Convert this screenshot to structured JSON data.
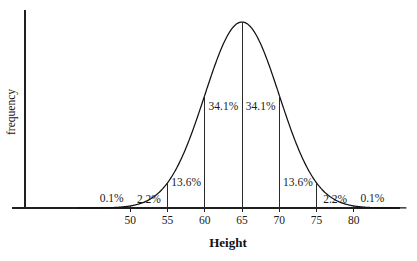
{
  "chart_data": {
    "type": "line",
    "title": "",
    "subtitle": "",
    "xlabel": "Height",
    "ylabel": "frequency",
    "distribution": "normal",
    "mean": 65,
    "std_dev": 5,
    "xlim": [
      43,
      87
    ],
    "ylim": [
      0,
      1
    ],
    "grid": false,
    "legend": false,
    "x_ticks": [
      50,
      55,
      60,
      65,
      70,
      75,
      80
    ],
    "x_tick_labels": [
      "50",
      "55",
      "60",
      "65",
      "70",
      "75",
      "80"
    ],
    "y_ticks": [],
    "y_tick_labels": [],
    "divider_positions": [
      50,
      55,
      60,
      65,
      70,
      75,
      80
    ],
    "region_labels": [
      {
        "label": "0.1%",
        "x_center": 47.5,
        "value": 0.1
      },
      {
        "label": "2.2%",
        "x_center": 52.5,
        "value": 2.2
      },
      {
        "label": "13.6%",
        "x_center": 57.5,
        "value": 13.6
      },
      {
        "label": "34.1%",
        "x_center": 62.5,
        "value": 34.1
      },
      {
        "label": "34.1%",
        "x_center": 67.5,
        "value": 34.1
      },
      {
        "label": "13.6%",
        "x_center": 72.5,
        "value": 13.6
      },
      {
        "label": "2.2%",
        "x_center": 77.5,
        "value": 2.2
      },
      {
        "label": "0.1%",
        "x_center": 82.5,
        "value": 0.1
      }
    ],
    "series": [
      {
        "name": "normal curve",
        "values": [
          0.1,
          2.2,
          13.6,
          34.1,
          34.1,
          13.6,
          2.2,
          0.1
        ]
      }
    ],
    "colors": {
      "curve": "#111111",
      "axis": "#202020",
      "divider": "#2a2a2a",
      "text": "#1a1a1a",
      "background": "#ffffff"
    }
  }
}
